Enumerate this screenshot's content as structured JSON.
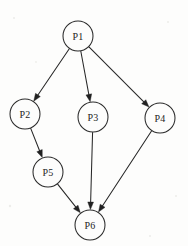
{
  "diagram": {
    "type": "directed-graph",
    "background_color": "#fdfdfc",
    "stroke_color": "#272727",
    "node_fill_color": "#fdfdfc",
    "label_color": "#1d1d1d",
    "node_radius": 15,
    "nodes": [
      {
        "id": "P1",
        "label": "P1",
        "cx": 78,
        "cy": 36,
        "r": 15
      },
      {
        "id": "P2",
        "label": "P2",
        "cx": 25,
        "cy": 114,
        "r": 15
      },
      {
        "id": "P3",
        "label": "P3",
        "cx": 93,
        "cy": 117,
        "r": 15
      },
      {
        "id": "P4",
        "label": "P4",
        "cx": 160,
        "cy": 118,
        "r": 15
      },
      {
        "id": "P5",
        "label": "P5",
        "cx": 48,
        "cy": 172,
        "r": 15
      },
      {
        "id": "P6",
        "label": "P6",
        "cx": 90,
        "cy": 225,
        "r": 15
      }
    ],
    "edges": [
      {
        "id": "e1",
        "from": "P1",
        "to": "P2",
        "directed": true
      },
      {
        "id": "e2",
        "from": "P1",
        "to": "P3",
        "directed": true
      },
      {
        "id": "e3",
        "from": "P1",
        "to": "P4",
        "directed": true
      },
      {
        "id": "e4",
        "from": "P2",
        "to": "P5",
        "directed": true
      },
      {
        "id": "e5",
        "from": "P3",
        "to": "P6",
        "directed": true
      },
      {
        "id": "e6",
        "from": "P4",
        "to": "P6",
        "directed": true
      },
      {
        "id": "e7",
        "from": "P5",
        "to": "P6",
        "directed": true
      }
    ]
  }
}
